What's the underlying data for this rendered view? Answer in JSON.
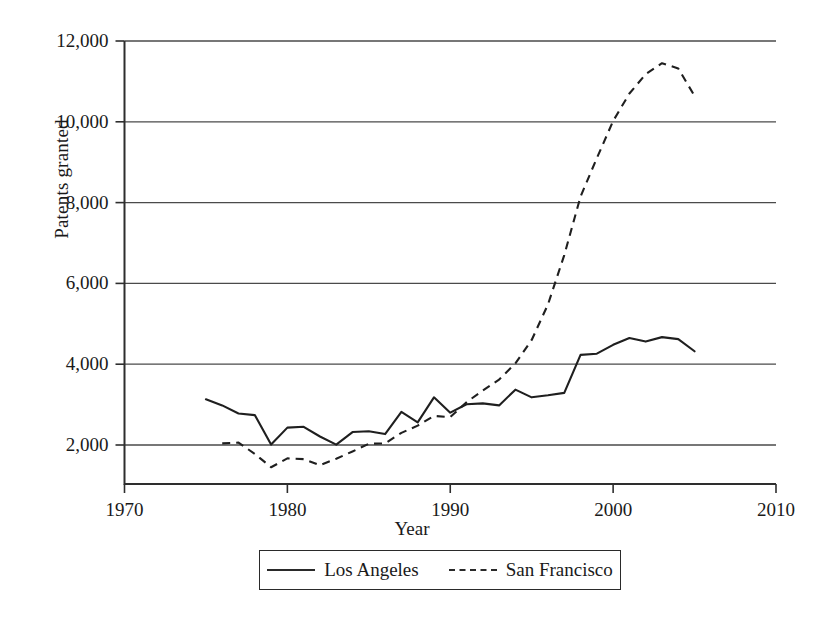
{
  "chart_data": {
    "type": "line",
    "title": "",
    "xlabel": "Year",
    "ylabel": "Patents granted",
    "xlim": [
      1970,
      2010
    ],
    "ylim": [
      1000,
      12000
    ],
    "xticks": [
      "1970",
      "1980",
      "1990",
      "2000",
      "2010"
    ],
    "xtick_values": [
      1970,
      1980,
      1990,
      2000,
      2010
    ],
    "yticks": [
      "2,000",
      "4,000",
      "6,000",
      "8,000",
      "10,000",
      "12,000"
    ],
    "ytick_values": [
      2000,
      4000,
      6000,
      8000,
      10000,
      12000
    ],
    "grid": "horizontal",
    "legend_position": "below-plot",
    "series": [
      {
        "name": "Los Angeles",
        "style": "solid",
        "color": "#1f1f1f",
        "x": [
          1975,
          1976,
          1977,
          1978,
          1979,
          1980,
          1981,
          1982,
          1983,
          1984,
          1985,
          1986,
          1987,
          1988,
          1989,
          1990,
          1991,
          1992,
          1993,
          1994,
          1995,
          1996,
          1997,
          1998,
          1999,
          2000,
          2001,
          2002,
          2003,
          2004,
          2005
        ],
        "values": [
          3130,
          2980,
          2780,
          2740,
          2010,
          2430,
          2450,
          2210,
          2010,
          2320,
          2340,
          2270,
          2820,
          2560,
          3180,
          2800,
          3010,
          3030,
          2980,
          3370,
          3180,
          3230,
          3290,
          4230,
          4260,
          4480,
          4650,
          4560,
          4670,
          4620,
          4320
        ]
      },
      {
        "name": "San Francisco",
        "style": "dashed",
        "color": "#1f1f1f",
        "x": [
          1976,
          1977,
          1978,
          1979,
          1980,
          1981,
          1982,
          1983,
          1984,
          1985,
          1986,
          1987,
          1988,
          1989,
          1990,
          1991,
          1992,
          1993,
          1994,
          1995,
          1996,
          1997,
          1998,
          1999,
          2000,
          2001,
          2002,
          2003,
          2004,
          2005
        ],
        "values": [
          2040,
          2060,
          1780,
          1450,
          1670,
          1650,
          1500,
          1660,
          1840,
          2030,
          2040,
          2300,
          2480,
          2720,
          2690,
          3060,
          3350,
          3620,
          4020,
          4600,
          5480,
          6700,
          8150,
          9100,
          10020,
          10700,
          11180,
          11450,
          11320,
          10640
        ]
      }
    ]
  },
  "legend": {
    "items": [
      {
        "label": "Los Angeles",
        "style": "solid"
      },
      {
        "label": "San Francisco",
        "style": "dashed"
      }
    ]
  }
}
